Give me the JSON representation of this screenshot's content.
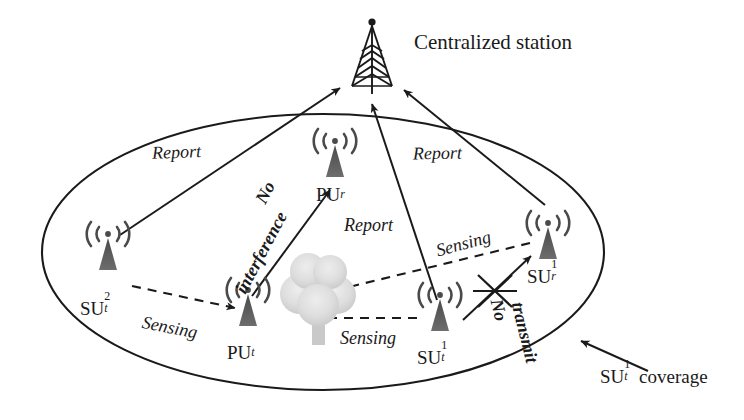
{
  "figure": {
    "kind": "cognitive-radio-network-diagram",
    "background": "#ffffff",
    "stroke_color": "#1a1a1a",
    "tree_color": "#d9d9d9",
    "antenna_color": "#555555",
    "coverage_shape": "ellipse"
  },
  "station": {
    "icon": "radio-tower-icon",
    "label": "Centralized station"
  },
  "nodes": [
    {
      "id": "su_t_2",
      "icon": "antenna-icon",
      "base": "SU",
      "sup": "2",
      "sub": "t",
      "label": "SU2t"
    },
    {
      "id": "pu_t",
      "icon": "antenna-icon",
      "base": "PU",
      "sup": "",
      "sub": "t",
      "label": "PUt"
    },
    {
      "id": "pu_r",
      "icon": "antenna-icon",
      "base": "PU",
      "sup": "",
      "sub": "r",
      "label": "PUr"
    },
    {
      "id": "su_t_1",
      "icon": "antenna-icon",
      "base": "SU",
      "sup": "1",
      "sub": "t",
      "label": "SU1t"
    },
    {
      "id": "su_r_1",
      "icon": "antenna-icon",
      "base": "SU",
      "sup": "1",
      "sub": "r",
      "label": "SU1r"
    }
  ],
  "obstacle": {
    "id": "tree",
    "icon": "tree-icon"
  },
  "edge_labels": {
    "report_left": "Report",
    "report_right": "Report",
    "report_center": "Report",
    "no_interference_line1": "No",
    "no_interference_line2": "interference",
    "sensing_left": "Sensing",
    "sensing_center": "Sensing",
    "sensing_right": "Sensing",
    "no_transmit_line1": "No",
    "no_transmit_line2": "transmit"
  },
  "callout": {
    "base": "SU",
    "sup": "1",
    "sub": "t",
    "suffix": "coverage",
    "label": "SU1t coverage"
  }
}
